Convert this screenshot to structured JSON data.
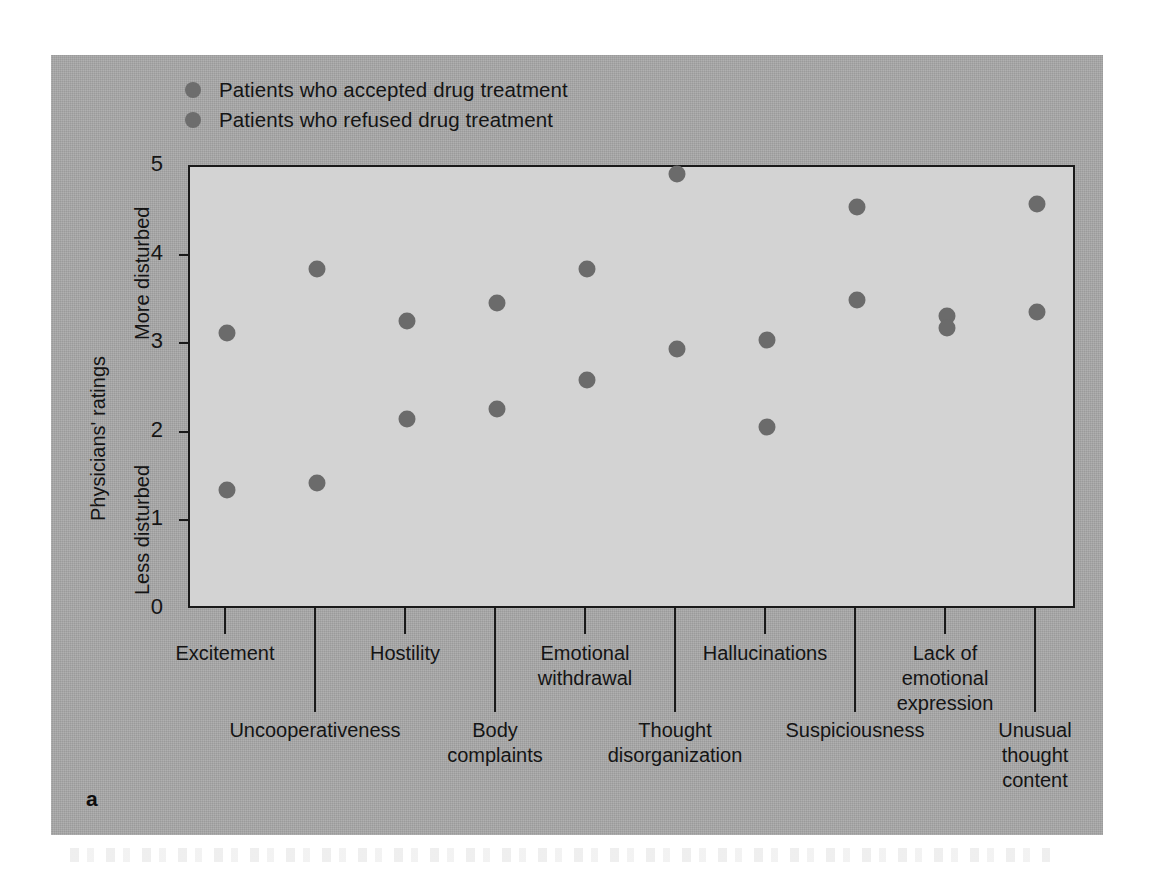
{
  "panel_letter": "a",
  "legend": {
    "items": [
      {
        "label": "Patients who accepted drug treatment",
        "color": "#6d6d6d",
        "marker": "circle"
      },
      {
        "label": "Patients who refused drug treatment",
        "color": "#6d6d6d",
        "marker": "circle"
      }
    ]
  },
  "axis": {
    "y_outer_label": "Physicians' ratings",
    "y_high_label": "More disturbed",
    "y_low_label": "Less disturbed",
    "y_ticks": [
      "0",
      "1",
      "2",
      "3",
      "4",
      "5"
    ]
  },
  "chart_data": {
    "type": "scatter",
    "title": "",
    "xlabel": "",
    "ylabel": "Physicians' ratings",
    "ylim": [
      0,
      5
    ],
    "yticks": [
      0,
      1,
      2,
      3,
      4,
      5
    ],
    "grid": false,
    "legend_position": "top-left",
    "annotations": [
      "More disturbed",
      "Less disturbed",
      "a"
    ],
    "categories": [
      "Excitement",
      "Uncooperativeness",
      "Hostility",
      "Body complaints",
      "Emotional withdrawal",
      "Thought disorganization",
      "Hallucinations",
      "Suspiciousness",
      "Lack of emotional expression",
      "Unusual thought content"
    ],
    "series": [
      {
        "name": "Patients who accepted drug treatment",
        "values": [
          3.13,
          3.85,
          3.26,
          3.46,
          3.85,
          4.92,
          3.05,
          4.55,
          3.32,
          4.58
        ]
      },
      {
        "name": "Patients who refused drug treatment",
        "values": [
          1.36,
          1.43,
          2.16,
          2.27,
          2.6,
          2.95,
          2.06,
          3.5,
          3.18,
          3.36
        ]
      }
    ]
  },
  "x_axis_layout": {
    "row": [
      "top",
      "bottom",
      "top",
      "bottom",
      "top",
      "bottom",
      "top",
      "bottom",
      "top",
      "bottom"
    ],
    "label_lines": [
      [
        "Excitement"
      ],
      [
        "Uncooperativeness"
      ],
      [
        "Hostility"
      ],
      [
        "Body",
        "complaints"
      ],
      [
        "Emotional",
        "withdrawal"
      ],
      [
        "Thought",
        "disorganization"
      ],
      [
        "Hallucinations"
      ],
      [
        "Suspiciousness"
      ],
      [
        "Lack of",
        "emotional",
        "expression"
      ],
      [
        "Unusual",
        "thought",
        "content"
      ]
    ]
  },
  "colors": {
    "panel_background": "#a8a8a8",
    "plot_background": "#d3d3d3",
    "marker": "#6b6b6b",
    "axis": "#1a1a1a",
    "text": "#141414"
  }
}
